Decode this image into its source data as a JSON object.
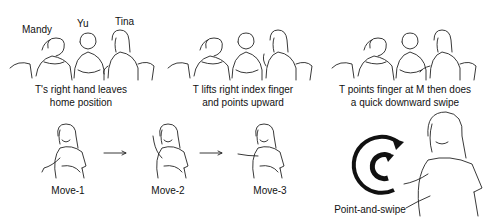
{
  "figure": {
    "top_row": {
      "panels": [
        {
          "id": "panel-1",
          "people_labels": [
            "Mandy",
            "Yu",
            "Tina"
          ],
          "caption_lines": [
            "T's right hand leaves",
            "home position"
          ]
        },
        {
          "id": "panel-2",
          "caption_lines": [
            "T lifts right index finger",
            "and points upward"
          ]
        },
        {
          "id": "panel-3",
          "caption_lines": [
            "T points finger at M then does",
            "a quick downward swipe"
          ]
        }
      ]
    },
    "bottom_row": {
      "moves": [
        {
          "label": "Move-1"
        },
        {
          "label": "Move-2"
        },
        {
          "label": "Move-3"
        }
      ],
      "arrows": [
        "right-arrow",
        "right-arrow"
      ],
      "gesture_detail": {
        "label": "Point-and-swipe",
        "icon": "circular-arrow-icon"
      }
    }
  }
}
